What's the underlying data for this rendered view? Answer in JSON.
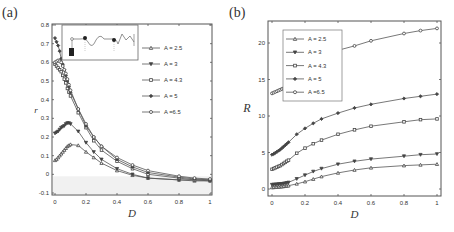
{
  "panels": {
    "a": {
      "label": "(a)",
      "xlabel": "D",
      "ylabel": "r",
      "legend": [
        "A = 2.5",
        "A = 3",
        "A = 4.3",
        "A = 5",
        "A =6.5"
      ]
    },
    "b": {
      "label": "(b)",
      "xlabel": "D",
      "ylabel": "R",
      "legend": [
        "A = 2.5",
        "A = 3",
        "A = 4.3",
        "A = 5",
        "A =6.5"
      ]
    }
  },
  "chart_data": [
    {
      "type": "line",
      "title": "(a)",
      "xlabel": "D",
      "ylabel": "r",
      "xlim": [
        0,
        1
      ],
      "ylim": [
        -0.1,
        0.8
      ],
      "xticks": [
        "0",
        "0.2",
        "0.4",
        "0.6",
        "0.8",
        "1"
      ],
      "yticks": [
        "-0.1",
        "0",
        "0.1",
        "0.2",
        "0.3",
        "0.4",
        "0.5",
        "0.6",
        "0.7",
        "0.8"
      ],
      "legend_position": "upper right",
      "grid": false,
      "has_inset": true,
      "x": [
        0,
        0.01,
        0.02,
        0.03,
        0.04,
        0.05,
        0.06,
        0.07,
        0.08,
        0.09,
        0.1,
        0.15,
        0.2,
        0.25,
        0.3,
        0.4,
        0.5,
        0.6,
        0.8,
        0.9,
        1.0
      ],
      "series": [
        {
          "name": "A = 2.5",
          "marker": "triangle-up",
          "values": [
            0.075,
            0.08,
            0.09,
            0.1,
            0.11,
            0.12,
            0.13,
            0.14,
            0.15,
            0.155,
            0.16,
            0.155,
            0.12,
            0.09,
            0.06,
            0.02,
            -0.005,
            -0.02,
            -0.03,
            -0.035,
            -0.035
          ]
        },
        {
          "name": "A = 3",
          "marker": "triangle-down",
          "values": [
            0.22,
            0.225,
            0.23,
            0.24,
            0.25,
            0.255,
            0.26,
            0.27,
            0.275,
            0.275,
            0.27,
            0.23,
            0.17,
            0.12,
            0.08,
            0.03,
            0.0,
            -0.02,
            -0.03,
            -0.03,
            -0.035
          ]
        },
        {
          "name": "A = 4.3",
          "marker": "square",
          "values": [
            0.59,
            0.58,
            0.57,
            0.56,
            0.55,
            0.53,
            0.51,
            0.49,
            0.46,
            0.44,
            0.42,
            0.33,
            0.25,
            0.18,
            0.13,
            0.07,
            0.03,
            0.0,
            -0.02,
            -0.03,
            -0.03
          ]
        },
        {
          "name": "A = 5",
          "marker": "diamond-filled",
          "values": [
            0.73,
            0.71,
            0.69,
            0.66,
            0.62,
            0.59,
            0.56,
            0.53,
            0.5,
            0.47,
            0.44,
            0.35,
            0.26,
            0.2,
            0.15,
            0.08,
            0.04,
            0.01,
            -0.015,
            -0.025,
            -0.03
          ]
        },
        {
          "name": "A =6.5",
          "marker": "circle",
          "values": [
            0.6,
            0.605,
            0.61,
            0.605,
            0.6,
            0.58,
            0.56,
            0.54,
            0.51,
            0.48,
            0.45,
            0.35,
            0.27,
            0.2,
            0.15,
            0.09,
            0.05,
            0.02,
            -0.01,
            -0.02,
            -0.025
          ]
        }
      ]
    },
    {
      "type": "line",
      "title": "(b)",
      "xlabel": "D",
      "ylabel": "R",
      "xlim": [
        0,
        1
      ],
      "ylim": [
        -1,
        22.5
      ],
      "xticks": [
        "0",
        "0.2",
        "0.4",
        "0.6",
        "0.8",
        "1"
      ],
      "yticks": [
        "0",
        "5",
        "10",
        "15",
        "20"
      ],
      "legend_position": "upper left",
      "grid": false,
      "x": [
        0,
        0.01,
        0.02,
        0.03,
        0.04,
        0.05,
        0.06,
        0.07,
        0.08,
        0.09,
        0.1,
        0.15,
        0.2,
        0.25,
        0.3,
        0.4,
        0.5,
        0.6,
        0.8,
        0.9,
        1.0
      ],
      "series": [
        {
          "name": "A = 2.5",
          "marker": "triangle-up",
          "values": [
            0.2,
            0.22,
            0.24,
            0.26,
            0.28,
            0.3,
            0.32,
            0.35,
            0.38,
            0.42,
            0.45,
            0.7,
            1.0,
            1.35,
            1.7,
            2.2,
            2.6,
            2.9,
            3.2,
            3.3,
            3.4
          ]
        },
        {
          "name": "A = 3",
          "marker": "triangle-down",
          "values": [
            0.6,
            0.62,
            0.64,
            0.66,
            0.68,
            0.7,
            0.72,
            0.75,
            0.8,
            0.85,
            0.9,
            1.4,
            1.9,
            2.4,
            2.8,
            3.4,
            3.8,
            4.1,
            4.5,
            4.7,
            4.8
          ]
        },
        {
          "name": "A = 4.3",
          "marker": "square",
          "values": [
            2.7,
            2.8,
            2.9,
            3.0,
            3.1,
            3.2,
            3.35,
            3.5,
            3.65,
            3.8,
            3.95,
            4.9,
            5.6,
            6.2,
            6.7,
            7.5,
            8.1,
            8.6,
            9.2,
            9.5,
            9.6
          ]
        },
        {
          "name": "A = 5",
          "marker": "diamond-filled",
          "values": [
            4.7,
            4.8,
            4.95,
            5.1,
            5.25,
            5.4,
            5.6,
            5.8,
            6.0,
            6.2,
            6.4,
            7.5,
            8.3,
            9.0,
            9.6,
            10.4,
            11.1,
            11.6,
            12.4,
            12.7,
            13.0
          ]
        },
        {
          "name": "A =6.5",
          "marker": "circle",
          "values": [
            13.1,
            13.2,
            13.3,
            13.4,
            13.5,
            13.6,
            13.7,
            13.8,
            13.9,
            14.0,
            14.1,
            15.3,
            16.5,
            17.5,
            18.2,
            19.0,
            19.6,
            20.3,
            21.3,
            21.7,
            22.0
          ]
        }
      ]
    }
  ]
}
